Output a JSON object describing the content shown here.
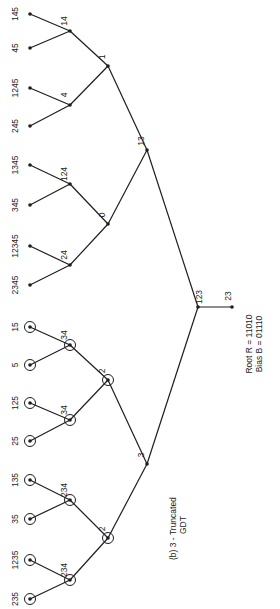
{
  "figure": {
    "caption_line1": "(b) 3 - Truncated",
    "caption_line2": "GDT",
    "root_note_line1": "Root R = 11010",
    "root_note_line2": "Bias B = 01110",
    "stroke_color": "#1e1e1e",
    "background": "#ffffff"
  },
  "tree": {
    "root": {
      "label": "123",
      "x": 198,
      "y": 307
    },
    "root_extra_leaf": {
      "label": "23",
      "x": 232,
      "y": 307
    },
    "level3": [
      {
        "label": "13",
        "x": 147,
        "y": 150,
        "circled": false
      },
      {
        "label": "3",
        "x": 147,
        "y": 464,
        "circled": false
      }
    ],
    "level2": [
      {
        "label": "1",
        "x": 108,
        "y": 66,
        "circled": false,
        "parent": 0
      },
      {
        "label": "0",
        "x": 108,
        "y": 224,
        "circled": false,
        "parent": 0
      },
      {
        "label": "2",
        "x": 108,
        "y": 380,
        "circled": true,
        "parent": 1
      },
      {
        "label": "2",
        "x": 108,
        "y": 538,
        "circled": true,
        "parent": 1
      }
    ],
    "level1": [
      {
        "label": "14",
        "x": 70,
        "y": 31,
        "circled": false,
        "parent": 0
      },
      {
        "label": "4",
        "x": 70,
        "y": 105,
        "circled": false,
        "parent": 0
      },
      {
        "label": "124",
        "x": 70,
        "y": 184,
        "circled": false,
        "parent": 1
      },
      {
        "label": "24",
        "x": 70,
        "y": 265,
        "circled": false,
        "parent": 1
      },
      {
        "label": "34",
        "x": 70,
        "y": 345,
        "circled": true,
        "parent": 2
      },
      {
        "label": "34",
        "x": 70,
        "y": 420,
        "circled": true,
        "parent": 2
      },
      {
        "label": "234",
        "x": 70,
        "y": 500,
        "circled": true,
        "parent": 3
      },
      {
        "label": "234",
        "x": 70,
        "y": 580,
        "circled": true,
        "parent": 3
      }
    ],
    "leaves": [
      {
        "label": "145",
        "x": 30,
        "y": 14,
        "circled": false,
        "parent": 0
      },
      {
        "label": "45",
        "x": 30,
        "y": 48,
        "circled": false,
        "parent": 0
      },
      {
        "label": "1245",
        "x": 30,
        "y": 88,
        "circled": false,
        "parent": 1
      },
      {
        "label": "245",
        "x": 30,
        "y": 126,
        "circled": false,
        "parent": 1
      },
      {
        "label": "1345",
        "x": 30,
        "y": 165,
        "circled": false,
        "parent": 2
      },
      {
        "label": "345",
        "x": 30,
        "y": 205,
        "circled": false,
        "parent": 2
      },
      {
        "label": "12345",
        "x": 30,
        "y": 246,
        "circled": false,
        "parent": 3
      },
      {
        "label": "2345",
        "x": 30,
        "y": 285,
        "circled": false,
        "parent": 3
      },
      {
        "label": "15",
        "x": 30,
        "y": 327,
        "circled": true,
        "parent": 4
      },
      {
        "label": "5",
        "x": 30,
        "y": 365,
        "circled": true,
        "parent": 4
      },
      {
        "label": "125",
        "x": 30,
        "y": 403,
        "circled": true,
        "parent": 5
      },
      {
        "label": "25",
        "x": 30,
        "y": 441,
        "circled": true,
        "parent": 5
      },
      {
        "label": "135",
        "x": 30,
        "y": 480,
        "circled": true,
        "parent": 6
      },
      {
        "label": "35",
        "x": 30,
        "y": 519,
        "circled": true,
        "parent": 6
      },
      {
        "label": "1235",
        "x": 30,
        "y": 560,
        "circled": true,
        "parent": 7
      },
      {
        "label": "235",
        "x": 30,
        "y": 599,
        "circled": true,
        "parent": 7
      }
    ]
  }
}
